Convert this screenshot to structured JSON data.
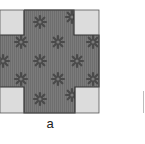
{
  "figure": {
    "panel_label": "a",
    "colors": {
      "fabric_background": "#7b7b7b",
      "fabric_stripe": "#6e6e6e",
      "motif": "#4a4a4a",
      "cutout_fill": "#dcdcdc",
      "outline": "#333333"
    },
    "shape": {
      "left": 0,
      "top": 10,
      "right": 99,
      "bottom": 113,
      "cutouts": [
        {
          "name": "top-left",
          "x": 0,
          "y": 10,
          "w": 24,
          "h": 25
        },
        {
          "name": "top-right",
          "x": 74,
          "y": 10,
          "w": 25,
          "h": 25
        },
        {
          "name": "bottom-left",
          "x": 0,
          "y": 87,
          "w": 24,
          "h": 26
        },
        {
          "name": "bottom-right",
          "x": 75,
          "y": 87,
          "w": 24,
          "h": 26
        }
      ]
    },
    "motifs": [
      {
        "x": 40,
        "y": 22
      },
      {
        "x": 72,
        "y": 17
      },
      {
        "x": 21,
        "y": 42
      },
      {
        "x": 58,
        "y": 42
      },
      {
        "x": 93,
        "y": 42
      },
      {
        "x": 3,
        "y": 61
      },
      {
        "x": 40,
        "y": 61
      },
      {
        "x": 77,
        "y": 61
      },
      {
        "x": 21,
        "y": 79
      },
      {
        "x": 58,
        "y": 79
      },
      {
        "x": 93,
        "y": 79
      },
      {
        "x": 40,
        "y": 99
      },
      {
        "x": 72,
        "y": 95
      }
    ]
  }
}
